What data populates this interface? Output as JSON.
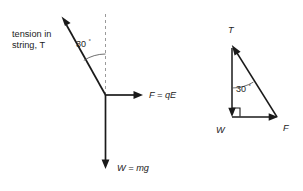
{
  "figure": {
    "background_color": "#ffffff",
    "stroke_color": "#1a1a1a",
    "dashed_color": "#9a9a9a",
    "arc_color": "#4a4a4a"
  },
  "free_body_diagram": {
    "name": "free-body-diagram",
    "tension_label_line1": "tension in",
    "tension_label_line2": "string, T",
    "angle_value": "30",
    "degree_symbol": "°",
    "electric_force_label": "F = qE",
    "weight_label": "W = mg",
    "vectors": [
      {
        "name": "tension",
        "label": "T",
        "direction": "up-left",
        "angle_from_vertical_deg": 30
      },
      {
        "name": "electric-force",
        "label": "F = qE",
        "direction": "right",
        "angle_from_vertical_deg": 90
      },
      {
        "name": "weight",
        "label": "W = mg",
        "direction": "down",
        "angle_from_vertical_deg": 180
      }
    ],
    "reference_line": "vertical-dashed"
  },
  "vector_triangle": {
    "name": "vector-triangle",
    "tension_label": "T",
    "weight_label": "W",
    "force_label": "F",
    "angle_value": "30",
    "degree_symbol": "°",
    "right_angle_marker": true,
    "sides": [
      {
        "name": "weight-side",
        "label": "W",
        "direction": "down"
      },
      {
        "name": "force-side",
        "label": "F",
        "direction": "right"
      },
      {
        "name": "tension-side",
        "label": "T",
        "direction": "up-left"
      }
    ]
  }
}
